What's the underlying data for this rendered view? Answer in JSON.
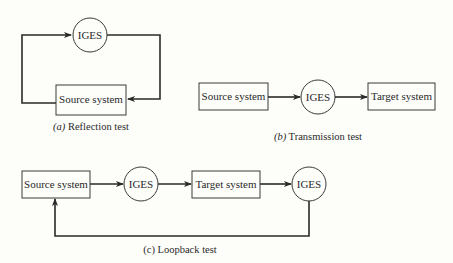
{
  "figure": {
    "reflection": {
      "caption_letter": "(a)",
      "caption_text": " Reflection test",
      "iges_label": "IGES",
      "source_label": "Source system"
    },
    "transmission": {
      "caption_letter": "(b)",
      "caption_text": " Transmission test",
      "source_label": "Source system",
      "iges_label": "IGES",
      "target_label": "Target system"
    },
    "loopback": {
      "caption": "(c) Loopback test",
      "source_label": "Source system",
      "iges1_label": "IGES",
      "target_label": "Target system",
      "iges2_label": "IGES"
    }
  },
  "colors": {
    "background": "#fdfdfa",
    "stroke": "#2a2a2a"
  }
}
